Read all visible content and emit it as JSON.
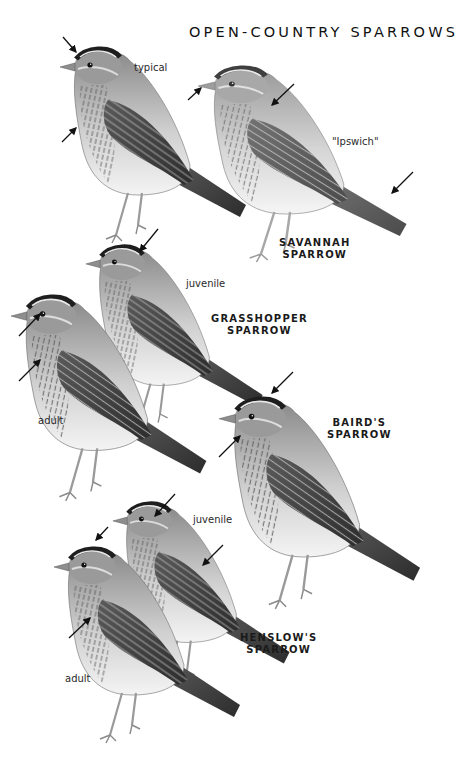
{
  "plate": {
    "title": "OPEN-COUNTRY SPARROWS",
    "background": "#ffffff",
    "ink": "#1a1a1a"
  },
  "species": [
    {
      "name_line1": "SAVANNAH",
      "name_line2": "SPARROW",
      "forms": [
        {
          "label": "typical",
          "icon": "savannah-sparrow-typical"
        },
        {
          "label": "\"Ipswich\"",
          "icon": "savannah-sparrow-ipswich"
        }
      ]
    },
    {
      "name_line1": "GRASSHOPPER",
      "name_line2": "SPARROW",
      "forms": [
        {
          "label": "juvenile",
          "icon": "grasshopper-sparrow-juvenile"
        },
        {
          "label": "adult",
          "icon": "grasshopper-sparrow-adult"
        }
      ]
    },
    {
      "name_line1": "BAIRD'S",
      "name_line2": "SPARROW",
      "forms": [
        {
          "label": "",
          "icon": "bairds-sparrow"
        }
      ]
    },
    {
      "name_line1": "HENSLOW'S",
      "name_line2": "SPARROW",
      "forms": [
        {
          "label": "juvenile",
          "icon": "henslows-sparrow-juvenile"
        },
        {
          "label": "adult",
          "icon": "henslows-sparrow-adult"
        }
      ]
    }
  ]
}
